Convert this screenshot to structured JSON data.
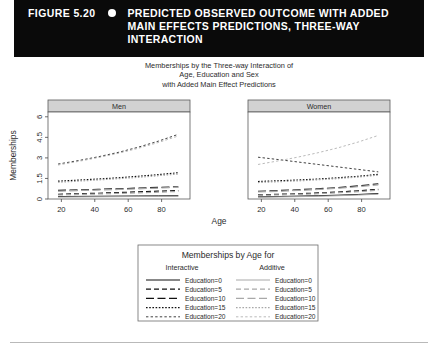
{
  "header": {
    "figure_number": "FIGURE 5.20",
    "bullet_icon": "circle-bullet-icon",
    "title_lines": [
      "PREDICTED OBSERVED OUTCOME WITH ADDED",
      "MAIN EFFECTS PREDICTIONS, THREE-WAY",
      "INTERACTION"
    ],
    "background_color": "#0a0a0a",
    "text_color": "#ffffff"
  },
  "chart_data": {
    "type": "line",
    "title_lines": [
      "Memberships by the Three-way Interaction of",
      "Age, Education and Sex",
      "with Added Main Effect Predictions"
    ],
    "xlabel": "Age",
    "ylabel": "Memberships",
    "xlim": [
      12,
      97
    ],
    "ylim": [
      0,
      6.35
    ],
    "xticks": [
      20,
      40,
      60,
      80
    ],
    "yticks": [
      "0",
      "1.5",
      "3",
      "4.5",
      "6"
    ],
    "ytick_values": [
      0,
      1.5,
      3,
      4.5,
      6
    ],
    "grid": false,
    "legend_position": "bottom",
    "panels": [
      {
        "label": "Men"
      },
      {
        "label": "Women"
      }
    ],
    "x": [
      18,
      30,
      42,
      54,
      66,
      78,
      90
    ],
    "series": [
      {
        "name": "Men Interactive Education=0",
        "panel": "Men",
        "group": "Interactive",
        "education": 0,
        "style": "solid",
        "color": "#111111",
        "values": [
          0.18,
          0.19,
          0.2,
          0.21,
          0.22,
          0.23,
          0.24
        ]
      },
      {
        "name": "Men Interactive Education=5",
        "panel": "Men",
        "group": "Interactive",
        "education": 5,
        "style": "dashed",
        "color": "#111111",
        "values": [
          0.34,
          0.38,
          0.42,
          0.47,
          0.52,
          0.57,
          0.62
        ]
      },
      {
        "name": "Men Interactive Education=10",
        "panel": "Men",
        "group": "Interactive",
        "education": 10,
        "style": "longdash",
        "color": "#111111",
        "values": [
          0.62,
          0.66,
          0.7,
          0.74,
          0.79,
          0.84,
          0.89
        ]
      },
      {
        "name": "Men Interactive Education=15",
        "panel": "Men",
        "group": "Interactive",
        "education": 15,
        "style": "dotted",
        "color": "#111111",
        "values": [
          1.3,
          1.38,
          1.46,
          1.55,
          1.66,
          1.78,
          1.92
        ]
      },
      {
        "name": "Men Interactive Education=20",
        "panel": "Men",
        "group": "Interactive",
        "education": 20,
        "style": "finedash",
        "color": "#111111",
        "values": [
          2.55,
          2.8,
          3.08,
          3.4,
          3.78,
          4.22,
          4.72
        ]
      },
      {
        "name": "Men Additive Education=0",
        "panel": "Men",
        "group": "Additive",
        "education": 0,
        "style": "solid",
        "color": "#a8a8a8",
        "values": [
          0.14,
          0.15,
          0.16,
          0.17,
          0.18,
          0.19,
          0.2
        ]
      },
      {
        "name": "Men Additive Education=5",
        "panel": "Men",
        "group": "Additive",
        "education": 5,
        "style": "dashed",
        "color": "#a8a8a8",
        "values": [
          0.3,
          0.33,
          0.37,
          0.41,
          0.45,
          0.5,
          0.55
        ]
      },
      {
        "name": "Men Additive Education=10",
        "panel": "Men",
        "group": "Additive",
        "education": 10,
        "style": "longdash",
        "color": "#a8a8a8",
        "values": [
          0.58,
          0.62,
          0.66,
          0.7,
          0.75,
          0.8,
          0.86
        ]
      },
      {
        "name": "Men Additive Education=15",
        "panel": "Men",
        "group": "Additive",
        "education": 15,
        "style": "dotted",
        "color": "#a8a8a8",
        "values": [
          1.22,
          1.3,
          1.39,
          1.48,
          1.58,
          1.7,
          1.82
        ]
      },
      {
        "name": "Men Additive Education=20",
        "panel": "Men",
        "group": "Additive",
        "education": 20,
        "style": "finedash",
        "color": "#a8a8a8",
        "values": [
          2.48,
          2.74,
          3.02,
          3.33,
          3.7,
          4.12,
          4.6
        ]
      },
      {
        "name": "Women Interactive Education=0",
        "panel": "Women",
        "group": "Interactive",
        "education": 0,
        "style": "solid",
        "color": "#111111",
        "values": [
          0.16,
          0.18,
          0.21,
          0.24,
          0.28,
          0.33,
          0.4
        ]
      },
      {
        "name": "Women Interactive Education=5",
        "panel": "Women",
        "group": "Interactive",
        "education": 5,
        "style": "dashed",
        "color": "#111111",
        "values": [
          0.3,
          0.34,
          0.38,
          0.44,
          0.51,
          0.6,
          0.71
        ]
      },
      {
        "name": "Women Interactive Education=10",
        "panel": "Women",
        "group": "Interactive",
        "education": 10,
        "style": "longdash",
        "color": "#111111",
        "values": [
          0.56,
          0.61,
          0.67,
          0.74,
          0.83,
          0.95,
          1.1
        ]
      },
      {
        "name": "Women Interactive Education=15",
        "panel": "Women",
        "group": "Interactive",
        "education": 15,
        "style": "dotted",
        "color": "#111111",
        "values": [
          1.28,
          1.33,
          1.39,
          1.46,
          1.55,
          1.66,
          1.8
        ]
      },
      {
        "name": "Women Interactive Education=20",
        "panel": "Women",
        "group": "Interactive",
        "education": 20,
        "style": "finedash",
        "color": "#111111",
        "values": [
          3.05,
          2.88,
          2.7,
          2.52,
          2.34,
          2.16,
          1.98
        ]
      },
      {
        "name": "Women Additive Education=0",
        "panel": "Women",
        "group": "Additive",
        "education": 0,
        "style": "solid",
        "color": "#a8a8a8",
        "values": [
          0.13,
          0.15,
          0.17,
          0.2,
          0.24,
          0.29,
          0.35
        ]
      },
      {
        "name": "Women Additive Education=5",
        "panel": "Women",
        "group": "Additive",
        "education": 5,
        "style": "dashed",
        "color": "#a8a8a8",
        "values": [
          0.27,
          0.3,
          0.34,
          0.39,
          0.46,
          0.54,
          0.64
        ]
      },
      {
        "name": "Women Additive Education=10",
        "panel": "Women",
        "group": "Additive",
        "education": 10,
        "style": "longdash",
        "color": "#a8a8a8",
        "values": [
          0.52,
          0.57,
          0.63,
          0.7,
          0.79,
          0.9,
          1.04
        ]
      },
      {
        "name": "Women Additive Education=15",
        "panel": "Women",
        "group": "Additive",
        "education": 15,
        "style": "dotted",
        "color": "#a8a8a8",
        "values": [
          1.2,
          1.26,
          1.32,
          1.4,
          1.49,
          1.6,
          1.74
        ]
      },
      {
        "name": "Women Additive Education=20",
        "panel": "Women",
        "group": "Additive",
        "education": 20,
        "style": "finedash",
        "color": "#a8a8a8",
        "values": [
          2.52,
          2.78,
          3.06,
          3.38,
          3.74,
          4.16,
          4.64
        ]
      }
    ]
  },
  "legend": {
    "title": "Memberships by Age for",
    "columns": [
      {
        "heading": "Interactive",
        "color": "#111111",
        "entries": [
          {
            "label": "Education=0",
            "style": "solid"
          },
          {
            "label": "Education=5",
            "style": "dashed"
          },
          {
            "label": "Education=10",
            "style": "longdash"
          },
          {
            "label": "Education=15",
            "style": "dotted"
          },
          {
            "label": "Education=20",
            "style": "finedash"
          }
        ]
      },
      {
        "heading": "Additive",
        "color": "#a8a8a8",
        "entries": [
          {
            "label": "Education=0",
            "style": "solid"
          },
          {
            "label": "Education=5",
            "style": "dashed"
          },
          {
            "label": "Education=10",
            "style": "longdash"
          },
          {
            "label": "Education=15",
            "style": "dotted"
          },
          {
            "label": "Education=20",
            "style": "finedash"
          }
        ]
      }
    ]
  }
}
